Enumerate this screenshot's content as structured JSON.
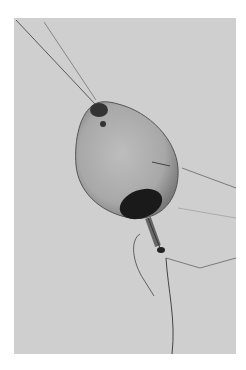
{
  "image": {
    "description": "Grayscale photograph of a translucent pear-shaped specimen suspended by fine threads, with a dark elliptical spot at its lower end and a stalk descending from it",
    "colors": {
      "background": "#ffffff",
      "photo_field": "#cfcfcf",
      "specimen_body": "#a9a9a9",
      "dark_spot": "#1a1a1a",
      "threads": "#3a3a3a"
    }
  }
}
